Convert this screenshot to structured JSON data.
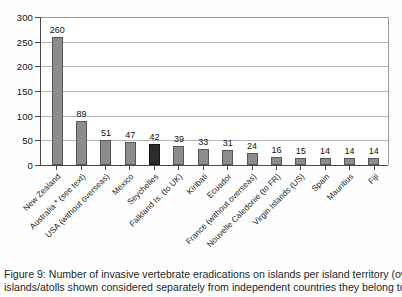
{
  "chart_data": {
    "type": "bar",
    "title": "",
    "xlabel": "",
    "ylabel": "",
    "ylim": [
      0,
      300
    ],
    "yticks": [
      0,
      50,
      100,
      150,
      200,
      250,
      300
    ],
    "grid": true,
    "legend": "none",
    "orientation": "vertical",
    "categories": [
      "New Zealand",
      "Australia * (see text)",
      "USA (without overseas)",
      "Mexico",
      "Seychelles",
      "Falkland Is. (to UK)",
      "Kiribati",
      "Ecuador",
      "France (without overseas)",
      "Nouvelle Caledonie (to FR)",
      "Virgin Islands (US)",
      "Spain",
      "Mauritius",
      "Fiji"
    ],
    "values": [
      260,
      89,
      51,
      47,
      42,
      39,
      33,
      31,
      24,
      16,
      15,
      14,
      14,
      14
    ],
    "bar_colors": [
      "#8c8c8c",
      "#8c8c8c",
      "#8c8c8c",
      "#8c8c8c",
      "#2b2b2b",
      "#8c8c8c",
      "#8c8c8c",
      "#8c8c8c",
      "#8c8c8c",
      "#8c8c8c",
      "#8c8c8c",
      "#8c8c8c",
      "#8c8c8c",
      "#8c8c8c"
    ],
    "highlighted_category": "Seychelles",
    "colors": {
      "bar": "#8c8c8c",
      "bar_highlight": "#2b2b2b",
      "grid": "#b4b4b4",
      "axis": "#4a4a4a"
    }
  },
  "caption": {
    "line1": "Figure 9: Number of invasive vertebrate eradications on islands per island territory (overseas dep",
    "line2": "islands/atolls shown considered separately from independent countries they belong to)"
  }
}
